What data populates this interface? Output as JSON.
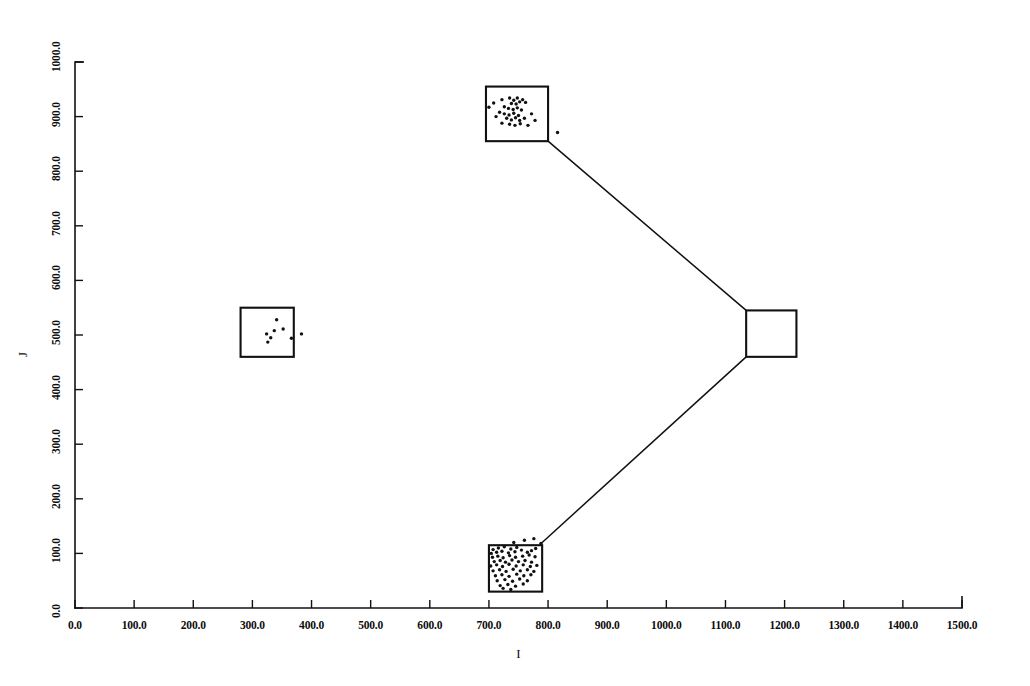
{
  "figure": {
    "background_color": "#ffffff",
    "ink_color": "#111111",
    "width": 1030,
    "height": 686
  },
  "chart_data": {
    "type": "scatter",
    "title": "",
    "subtitle": "",
    "xlabel": "I",
    "ylabel": "J",
    "xlim": [
      0,
      1500
    ],
    "ylim": [
      0,
      1000
    ],
    "grid": false,
    "legend": null,
    "x_ticks": [
      0,
      100,
      200,
      300,
      400,
      500,
      600,
      700,
      800,
      900,
      1000,
      1100,
      1200,
      1300,
      1400,
      1500
    ],
    "x_tick_labels": [
      "0.0",
      "100.0",
      "200.0",
      "300.0",
      "400.0",
      "500.0",
      "600.0",
      "700.0",
      "800.0",
      "900.0",
      "1000.0",
      "1100.0",
      "1200.0",
      "1300.0",
      "1400.0",
      "1500.0"
    ],
    "y_ticks": [
      0,
      100,
      200,
      300,
      400,
      500,
      600,
      700,
      800,
      900,
      1000
    ],
    "y_tick_labels": [
      "0.0",
      "100.0",
      "200.0",
      "300.0",
      "400.0",
      "500.0",
      "600.0",
      "700.0",
      "800.0",
      "900.0",
      "1000.0"
    ],
    "annotations": {
      "boxes": [
        {
          "name": "upper-cluster-box",
          "x0": 695,
          "y0": 855,
          "x1": 800,
          "y1": 955
        },
        {
          "name": "left-cluster-box",
          "x0": 280,
          "y0": 460,
          "x1": 370,
          "y1": 550
        },
        {
          "name": "lower-cluster-box",
          "x0": 700,
          "y0": 30,
          "x1": 790,
          "y1": 115
        },
        {
          "name": "right-empty-box",
          "x0": 1135,
          "y0": 460,
          "x1": 1220,
          "y1": 545
        }
      ],
      "connectors": [
        {
          "name": "upper-to-right-connector",
          "x1": 800,
          "y1": 855,
          "x2": 1135,
          "y2": 545
        },
        {
          "name": "lower-to-right-connector",
          "x1": 790,
          "y1": 120,
          "x2": 1135,
          "y2": 460
        }
      ]
    },
    "series": [
      {
        "name": "upper-cluster",
        "points": [
          [
            708,
            925
          ],
          [
            722,
            931
          ],
          [
            735,
            934
          ],
          [
            742,
            930
          ],
          [
            748,
            934
          ],
          [
            738,
            924
          ],
          [
            746,
            923
          ],
          [
            752,
            927
          ],
          [
            757,
            931
          ],
          [
            762,
            926
          ],
          [
            726,
            918
          ],
          [
            733,
            915
          ],
          [
            741,
            913
          ],
          [
            748,
            916
          ],
          [
            755,
            912
          ],
          [
            718,
            908
          ],
          [
            726,
            905
          ],
          [
            734,
            903
          ],
          [
            742,
            906
          ],
          [
            750,
            902
          ],
          [
            730,
            897
          ],
          [
            738,
            894
          ],
          [
            745,
            898
          ],
          [
            752,
            893
          ],
          [
            760,
            897
          ],
          [
            722,
            888
          ],
          [
            735,
            886
          ],
          [
            744,
            884
          ],
          [
            753,
            887
          ],
          [
            766,
            884
          ],
          [
            700,
            917
          ],
          [
            712,
            900
          ],
          [
            772,
            905
          ],
          [
            778,
            893
          ],
          [
            816,
            871
          ]
        ]
      },
      {
        "name": "left-cluster",
        "points": [
          [
            341,
            528
          ],
          [
            337,
            508
          ],
          [
            352,
            511
          ],
          [
            324,
            502
          ],
          [
            331,
            495
          ],
          [
            326,
            487
          ],
          [
            366,
            494
          ],
          [
            383,
            502
          ]
        ]
      },
      {
        "name": "lower-cluster",
        "points": [
          [
            707,
            107
          ],
          [
            716,
            110
          ],
          [
            726,
            112
          ],
          [
            737,
            108
          ],
          [
            747,
            111
          ],
          [
            704,
            100
          ],
          [
            713,
            102
          ],
          [
            722,
            104
          ],
          [
            733,
            101
          ],
          [
            744,
            103
          ],
          [
            755,
            106
          ],
          [
            765,
            102
          ],
          [
            772,
            105
          ],
          [
            779,
            109
          ],
          [
            706,
            93
          ],
          [
            715,
            95
          ],
          [
            724,
            92
          ],
          [
            735,
            96
          ],
          [
            745,
            93
          ],
          [
            757,
            95
          ],
          [
            768,
            97
          ],
          [
            778,
            94
          ],
          [
            709,
            85
          ],
          [
            719,
            87
          ],
          [
            728,
            84
          ],
          [
            739,
            88
          ],
          [
            750,
            85
          ],
          [
            761,
            87
          ],
          [
            772,
            84
          ],
          [
            703,
            77
          ],
          [
            713,
            79
          ],
          [
            723,
            76
          ],
          [
            734,
            80
          ],
          [
            746,
            77
          ],
          [
            758,
            79
          ],
          [
            770,
            76
          ],
          [
            781,
            78
          ],
          [
            707,
            68
          ],
          [
            718,
            70
          ],
          [
            729,
            67
          ],
          [
            741,
            71
          ],
          [
            753,
            68
          ],
          [
            765,
            70
          ],
          [
            776,
            67
          ],
          [
            711,
            59
          ],
          [
            722,
            61
          ],
          [
            734,
            58
          ],
          [
            747,
            62
          ],
          [
            759,
            59
          ],
          [
            771,
            61
          ],
          [
            714,
            50
          ],
          [
            727,
            52
          ],
          [
            740,
            49
          ],
          [
            752,
            53
          ],
          [
            765,
            50
          ],
          [
            719,
            41
          ],
          [
            732,
            43
          ],
          [
            745,
            40
          ],
          [
            758,
            44
          ],
          [
            742,
            120
          ],
          [
            760,
            124
          ],
          [
            776,
            127
          ],
          [
            788,
            118
          ],
          [
            724,
            36
          ],
          [
            737,
            34
          ]
        ]
      },
      {
        "name": "right-cluster",
        "points": []
      }
    ]
  },
  "plot_geometry": {
    "px_left": 75,
    "px_right": 962,
    "px_top": 62,
    "px_bottom": 608
  }
}
